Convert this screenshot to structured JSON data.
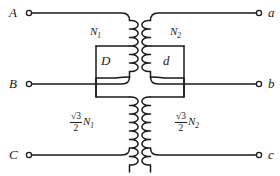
{
  "figure": {
    "type": "electrical-schematic",
    "line_color": "#1a1a1a",
    "background_color": "#ffffff"
  },
  "terminals": {
    "left": [
      {
        "id": "A",
        "label": "A",
        "y": 13
      },
      {
        "id": "B",
        "label": "B",
        "y": 84
      },
      {
        "id": "C",
        "label": "C",
        "y": 155
      }
    ],
    "right": [
      {
        "id": "a",
        "label": "a",
        "y": 13
      },
      {
        "id": "b",
        "label": "b",
        "y": 84
      },
      {
        "id": "c",
        "label": "c",
        "y": 155
      }
    ]
  },
  "windings": {
    "left_top": {
      "label_n": "N",
      "label_sub": "1",
      "full": "N1"
    },
    "right_top": {
      "label_n": "N",
      "label_sub": "2",
      "full": "N2"
    },
    "left_bottom": {
      "numerator": "√3",
      "denominator": "2",
      "label_n": "N",
      "label_sub": "1",
      "full": "(√3/2)N1"
    },
    "right_bottom": {
      "numerator": "√3",
      "denominator": "2",
      "label_n": "N",
      "label_sub": "2",
      "full": "(√3/2)N2"
    }
  },
  "boxes": {
    "left": {
      "label": "D"
    },
    "right": {
      "label": "d"
    }
  }
}
